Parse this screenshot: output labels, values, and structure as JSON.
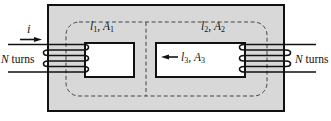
{
  "labels": {
    "current": {
      "symbol": "i"
    },
    "left_winding": {
      "n": "N",
      "rest": " turns"
    },
    "right_winding": {
      "n": "N",
      "rest": " turns"
    },
    "path1": {
      "v1": "l",
      "s1": "1",
      "sep": ", ",
      "v2": "A",
      "s2": "1"
    },
    "path2": {
      "v1": "l",
      "s1": "2",
      "sep": ", ",
      "v2": "A",
      "s2": "2"
    },
    "path3": {
      "v1": "l",
      "s1": "3",
      "sep": ", ",
      "v2": "A",
      "s2": "3"
    }
  },
  "colors": {
    "background": "#ffffff",
    "core_fill": "#d8d8d8",
    "window_fill": "#ffffff",
    "outline": "#111111",
    "dashed": "#444444"
  }
}
